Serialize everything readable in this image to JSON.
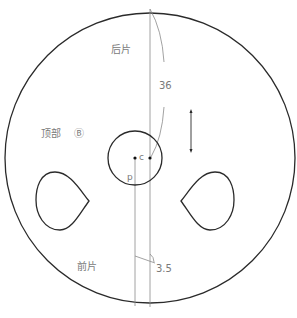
{
  "diagram": {
    "labels": {
      "back_piece": "后片",
      "top_piece": "顶部",
      "piece_marker": "Ⓑ",
      "front_piece": "前片",
      "dimension_36": "36",
      "dimension_3_5": "3.5",
      "point_c": "c",
      "point_p": "p"
    },
    "colors": {
      "outline": "#2a2a2a",
      "guide_line": "#8a8a8a",
      "text": "#7a7a7a",
      "background": "#ffffff"
    }
  }
}
